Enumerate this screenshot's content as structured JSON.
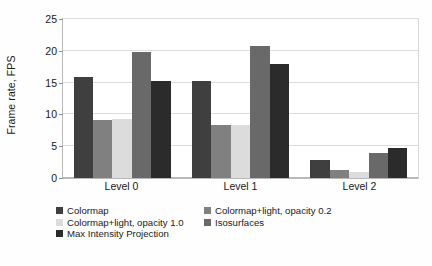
{
  "chart_data": {
    "type": "bar",
    "title": "",
    "xlabel": "",
    "ylabel": "Frame rate, FPS",
    "categories": [
      "Level 0",
      "Level 1",
      "Level 2"
    ],
    "ylim": [
      0,
      25
    ],
    "yticks": [
      0,
      5,
      10,
      15,
      20,
      25
    ],
    "ytick_labels": [
      "0",
      "5",
      "10",
      "15",
      "20",
      "25"
    ],
    "grid": true,
    "legend_position": "bottom",
    "series": [
      {
        "name": "Colormap",
        "color": "#3f3f3f",
        "values": [
          15.9,
          15.3,
          2.8
        ]
      },
      {
        "name": "Colormap+light, opacity 0.2",
        "color": "#808080",
        "values": [
          9.1,
          8.3,
          1.2
        ]
      },
      {
        "name": "Colormap+light, opacity 1.0",
        "color": "#dcdcdc",
        "values": [
          9.3,
          8.3,
          1.0
        ]
      },
      {
        "name": "Isosurfaces",
        "color": "#696969",
        "values": [
          19.8,
          20.7,
          4.0
        ]
      },
      {
        "name": "Max Intensity Projection",
        "color": "#2b2b2b",
        "values": [
          15.2,
          18.0,
          4.7
        ]
      }
    ]
  }
}
